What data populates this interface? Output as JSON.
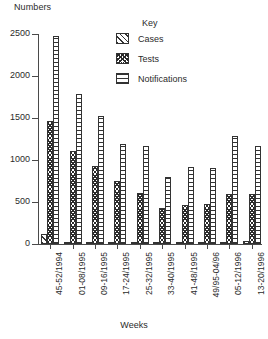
{
  "chart_data": {
    "type": "bar",
    "title": "",
    "ylabel": "Numbers",
    "xlabel": "Weeks",
    "ylim": [
      0,
      2500
    ],
    "yticks": [
      0,
      500,
      1000,
      1500,
      2000,
      2500
    ],
    "grid": false,
    "legend_title": "Key",
    "legend_position": "top-right",
    "categories": [
      "45-52/1994",
      "01-08/1995",
      "09-16/1995",
      "17-24/1995",
      "25-32/1995",
      "33-40/1995",
      "41-48/1995",
      "49/95-04/96",
      "05-12/1996",
      "13-20/1996"
    ],
    "series": [
      {
        "name": "Cases",
        "pattern": "diagonal-hatch",
        "values": [
          120,
          25,
          22,
          20,
          18,
          20,
          18,
          16,
          22,
          30
        ]
      },
      {
        "name": "Tests",
        "pattern": "cross-hatch",
        "values": [
          1460,
          1110,
          930,
          750,
          610,
          430,
          470,
          480,
          600,
          590
        ]
      },
      {
        "name": "Notifications",
        "pattern": "horizontal-hatch",
        "values": [
          2480,
          1790,
          1520,
          1190,
          1170,
          800,
          920,
          910,
          1280,
          1170
        ]
      }
    ]
  },
  "axis": {
    "y_title": "Numbers",
    "x_title": "Weeks",
    "tick_labels": [
      "2500",
      "2000",
      "1500",
      "1000",
      "500",
      "0"
    ]
  },
  "legend": {
    "title": "Key",
    "entries": [
      {
        "label": "Cases",
        "icon": "diagonal-hatch-swatch"
      },
      {
        "label": "Tests",
        "icon": "cross-hatch-swatch"
      },
      {
        "label": "Notifications",
        "icon": "horizontal-hatch-swatch"
      }
    ]
  },
  "colors": {
    "ink": "#333333",
    "axis": "#4a4a4a",
    "background": "#ffffff"
  }
}
